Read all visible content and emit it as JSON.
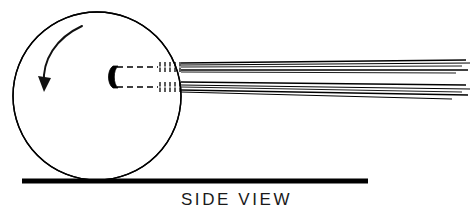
{
  "figure": {
    "caption": "SIDE VIEW",
    "view_label": "SIDE VIEW",
    "width": 473,
    "height": 218,
    "background_color": "#ffffff",
    "ink_color": "#000000"
  },
  "diagram": {
    "type": "technical-line-drawing",
    "disc": {
      "name": "rotating-disc",
      "shape": "circle",
      "center_x": 97,
      "center_y": 96,
      "radius": 84,
      "stroke_width": 1.4,
      "stroke_color": "#000000",
      "fill": "none"
    },
    "rotation_arrow": {
      "name": "rotation-arrow",
      "direction": "counter-clockwise",
      "label": "",
      "stroke_width": 2.0,
      "stroke_color": "#111111",
      "path": "M 82 26 C 56 38 42 60 44 84",
      "arrowhead_points": "44,92 38,76 51,78"
    },
    "nozzle": {
      "name": "nozzle-tip",
      "shape": "solid-crescent",
      "x": 109,
      "y": 66,
      "width": 9,
      "height": 22,
      "fill": "#000000"
    },
    "nozzle_body": {
      "name": "nozzle-body-dashed-outline",
      "line_style": "dashed",
      "dash_pattern": "6 4",
      "stroke_width": 1.4,
      "top_y": 67,
      "bottom_y": 87,
      "start_x": 117,
      "end_x": 158
    },
    "stipple_bands": [
      {
        "name": "stipple-band-upper",
        "x_start": 160,
        "x_end": 180,
        "y_top": 62,
        "y_bottom": 72,
        "tick_count": 5,
        "stroke_width": 1.3
      },
      {
        "name": "stipple-band-lower",
        "x_start": 160,
        "x_end": 180,
        "y_top": 82,
        "y_bottom": 92,
        "tick_count": 5,
        "stroke_width": 1.3
      }
    ],
    "stream_bundles": [
      {
        "name": "stream-bundle-upper",
        "origin_x": 181,
        "lines": [
          {
            "x1": 181,
            "y1": 63,
            "x2": 466,
            "y2": 60,
            "width": 1.5
          },
          {
            "x1": 181,
            "y1": 65,
            "x2": 470,
            "y2": 63,
            "width": 1.0
          },
          {
            "x1": 181,
            "y1": 67,
            "x2": 462,
            "y2": 66,
            "width": 0.9
          },
          {
            "x1": 181,
            "y1": 70,
            "x2": 468,
            "y2": 70,
            "width": 1.5
          },
          {
            "x1": 181,
            "y1": 72,
            "x2": 456,
            "y2": 73,
            "width": 0.9
          }
        ]
      },
      {
        "name": "stream-bundle-lower",
        "origin_x": 181,
        "lines": [
          {
            "x1": 181,
            "y1": 82,
            "x2": 466,
            "y2": 85,
            "width": 1.5
          },
          {
            "x1": 181,
            "y1": 85,
            "x2": 470,
            "y2": 89,
            "width": 1.0
          },
          {
            "x1": 181,
            "y1": 87,
            "x2": 462,
            "y2": 92,
            "width": 0.9
          },
          {
            "x1": 181,
            "y1": 90,
            "x2": 468,
            "y2": 95,
            "width": 1.5
          },
          {
            "x1": 181,
            "y1": 92,
            "x2": 452,
            "y2": 99,
            "width": 1.1
          }
        ]
      }
    ],
    "ground_line": {
      "name": "ground-line",
      "x1": 22,
      "x2": 368,
      "y": 181,
      "thickness": 5,
      "color": "#000000"
    }
  }
}
